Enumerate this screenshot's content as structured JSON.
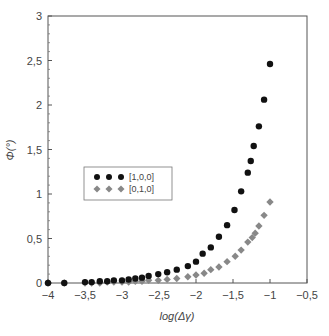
{
  "chart_data": {
    "type": "scatter",
    "title": "",
    "xlabel": "log(Δγ)",
    "ylabel": "Φ(°)",
    "xlim": [
      -4,
      -0.5
    ],
    "ylim": [
      0,
      3
    ],
    "x_ticks": [
      -4,
      -3.5,
      -3,
      -2.5,
      -2,
      -1.5,
      -1,
      -0.5
    ],
    "x_tick_labels": [
      "-4",
      "-3,5",
      "-3",
      "-2,5",
      "-2",
      "-1,5",
      "-1",
      "-0,5"
    ],
    "y_ticks": [
      0,
      0.5,
      1,
      1.5,
      2,
      2.5,
      3
    ],
    "y_tick_labels": [
      "0",
      "0,5",
      "1",
      "1,5",
      "2",
      "2,5",
      "3"
    ],
    "grid": false,
    "legend_position": "center-left",
    "series": [
      {
        "name": "[1,0,0]",
        "marker": "circle",
        "color": "#111111",
        "x": [
          -4.0,
          -3.78,
          -3.5,
          -3.41,
          -3.3,
          -3.2,
          -3.11,
          -3.0,
          -2.91,
          -2.82,
          -2.73,
          -2.64,
          -2.51,
          -2.39,
          -2.26,
          -2.11,
          -2.0,
          -1.91,
          -1.8,
          -1.69,
          -1.58,
          -1.48,
          -1.39,
          -1.3,
          -1.26,
          -1.22,
          -1.15,
          -1.08,
          -1.0
        ],
        "y": [
          0.0,
          0.0,
          0.01,
          0.01,
          0.02,
          0.02,
          0.03,
          0.03,
          0.04,
          0.05,
          0.06,
          0.08,
          0.1,
          0.12,
          0.15,
          0.19,
          0.24,
          0.33,
          0.4,
          0.52,
          0.65,
          0.82,
          1.03,
          1.24,
          1.37,
          1.54,
          1.76,
          2.06,
          2.46
        ]
      },
      {
        "name": "[0,1,0]",
        "marker": "diamond",
        "color": "#888888",
        "x": [
          -4.0,
          -3.78,
          -3.5,
          -3.41,
          -3.3,
          -3.2,
          -3.11,
          -3.0,
          -2.91,
          -2.82,
          -2.73,
          -2.64,
          -2.51,
          -2.39,
          -2.26,
          -2.11,
          -2.0,
          -1.89,
          -1.8,
          -1.69,
          -1.58,
          -1.47,
          -1.39,
          -1.3,
          -1.24,
          -1.2,
          -1.15,
          -1.08,
          -1.0
        ],
        "y": [
          0.0,
          0.0,
          0.0,
          0.0,
          0.0,
          0.01,
          0.01,
          0.01,
          0.01,
          0.02,
          0.02,
          0.03,
          0.03,
          0.04,
          0.05,
          0.07,
          0.09,
          0.11,
          0.15,
          0.18,
          0.24,
          0.3,
          0.37,
          0.46,
          0.51,
          0.56,
          0.64,
          0.76,
          0.91
        ]
      }
    ]
  },
  "legend": {
    "items": [
      {
        "label": "[1,0,0]"
      },
      {
        "label": "[0,1,0]"
      }
    ]
  },
  "axes": {
    "xlabel": "log(Δγ)",
    "ylabel": "Φ(°)"
  }
}
